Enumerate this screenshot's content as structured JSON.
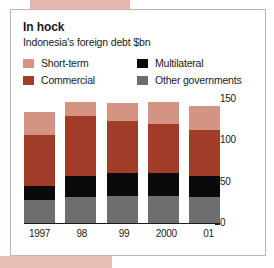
{
  "title": "In hock",
  "subtitle": "Indonesia's foreign debt $bn",
  "colors": {
    "short_term": "#d39484",
    "commercial": "#a03c28",
    "multilateral": "#0b0a0a",
    "other_governments": "#6e6e6e",
    "frame_border": "#cbb0ac",
    "text": "#1a1a1a",
    "page_bleed": "#e3b7ab"
  },
  "legend": {
    "left": [
      {
        "label": "Short-term",
        "key": "short_term"
      },
      {
        "label": "Commercial",
        "key": "commercial"
      }
    ],
    "right": [
      {
        "label": "Multilateral",
        "key": "multilateral"
      },
      {
        "label": "Other governments",
        "key": "other_governments"
      }
    ]
  },
  "chart_data": {
    "type": "bar",
    "stacked": true,
    "title": "In hock",
    "subtitle": "Indonesia's foreign debt $bn",
    "xlabel": "",
    "ylabel": "$bn",
    "ylim": [
      0,
      150
    ],
    "yticks": [
      0,
      50,
      100,
      150
    ],
    "ytick_labels": [
      "0",
      "50",
      "100",
      "150"
    ],
    "grid": false,
    "legend_position": "top",
    "categories": [
      "1997",
      "98",
      "99",
      "2000",
      "01"
    ],
    "series": [
      {
        "name": "Other governments",
        "color": "#6e6e6e",
        "values": [
          28,
          32,
          33,
          33,
          32
        ]
      },
      {
        "name": "Multilateral",
        "color": "#0b0a0a",
        "values": [
          17,
          25,
          27,
          27,
          25
        ]
      },
      {
        "name": "Commercial",
        "color": "#a03c28",
        "values": [
          62,
          72,
          63,
          60,
          55
        ]
      },
      {
        "name": "Short-term",
        "color": "#d39484",
        "values": [
          27,
          17,
          22,
          26,
          29
        ]
      }
    ],
    "totals": [
      134,
      146,
      145,
      146,
      141
    ]
  }
}
